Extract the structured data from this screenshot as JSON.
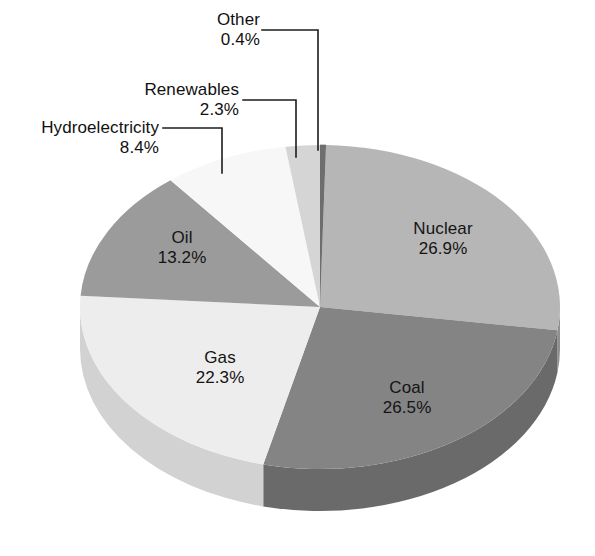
{
  "chart_data": {
    "type": "pie",
    "title": "",
    "subtitle": "",
    "xlabel": "",
    "ylabel": "",
    "legend_position": "none",
    "grid": false,
    "units": "percent",
    "total": 100.0,
    "start_angle_deg": 0,
    "direction": "clockwise",
    "categories": [
      "Other",
      "Nuclear",
      "Coal",
      "Gas",
      "Oil",
      "Hydroelectricity",
      "Renewables"
    ],
    "values": [
      0.4,
      26.9,
      26.5,
      22.3,
      13.2,
      8.4,
      2.3
    ],
    "slices": [
      {
        "label": "Other",
        "percent": 0.4,
        "percent_text": "0.4%",
        "color": "#6e6e6e",
        "side_color": "#4f4f4f",
        "label_placement": "callout"
      },
      {
        "label": "Nuclear",
        "percent": 26.9,
        "percent_text": "26.9%",
        "color": "#b6b6b6",
        "side_color": "#8f8f8f",
        "label_placement": "inside"
      },
      {
        "label": "Coal",
        "percent": 26.5,
        "percent_text": "26.5%",
        "color": "#848484",
        "side_color": "#6a6a6a",
        "label_placement": "inside"
      },
      {
        "label": "Gas",
        "percent": 22.3,
        "percent_text": "22.3%",
        "color": "#ededed",
        "side_color": "#d2d2d2",
        "label_placement": "inside"
      },
      {
        "label": "Oil",
        "percent": 13.2,
        "percent_text": "13.2%",
        "color": "#9b9b9b",
        "side_color": "#7c7c7c",
        "label_placement": "inside"
      },
      {
        "label": "Hydroelectricity",
        "percent": 8.4,
        "percent_text": "8.4%",
        "color": "#f7f7f7",
        "side_color": "#dcdcdc",
        "label_placement": "callout"
      },
      {
        "label": "Renewables",
        "percent": 2.3,
        "percent_text": "2.3%",
        "color": "#d5d5d5",
        "side_color": "#b4b4b4",
        "label_placement": "callout"
      }
    ]
  },
  "labels": {
    "other": {
      "name": "Other",
      "percent": "0.4%"
    },
    "renewables": {
      "name": "Renewables",
      "percent": "2.3%"
    },
    "hydroelectricity": {
      "name": "Hydroelectricity",
      "percent": "8.4%"
    },
    "oil": {
      "name": "Oil",
      "percent": "13.2%"
    },
    "gas": {
      "name": "Gas",
      "percent": "22.3%"
    },
    "coal": {
      "name": "Coal",
      "percent": "26.5%"
    },
    "nuclear": {
      "name": "Nuclear",
      "percent": "26.9%"
    }
  },
  "colors": {
    "background": "#ffffff",
    "text": "#141414",
    "leader_line": "#1c1c1c"
  }
}
